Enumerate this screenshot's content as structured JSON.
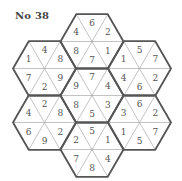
{
  "puzzle": {
    "title": "No 38",
    "layout": "flower-of-7-hexagons",
    "triangle_order": [
      "top",
      "top-right",
      "bottom-right",
      "bottom",
      "bottom-left",
      "top-left"
    ],
    "hexagons": [
      {
        "position": "top",
        "values": [
          "6",
          "2",
          "1",
          "7",
          "8",
          "4"
        ]
      },
      {
        "position": "upper-left",
        "values": [
          "4",
          "8",
          "9",
          "2",
          "7",
          "1"
        ]
      },
      {
        "position": "upper-right",
        "values": [
          "5",
          "7",
          "2",
          "6",
          "4",
          "1"
        ]
      },
      {
        "position": "center",
        "values": [
          "7",
          "4",
          "3",
          "5",
          "8",
          "9"
        ]
      },
      {
        "position": "lower-left",
        "values": [
          "2",
          "8",
          "2",
          "9",
          "6",
          "4"
        ]
      },
      {
        "position": "lower-right",
        "values": [
          "6",
          "2",
          "7",
          "5",
          "1",
          "3"
        ]
      },
      {
        "position": "bottom",
        "values": [
          "5",
          "1",
          "4",
          "8",
          "7",
          "2"
        ]
      }
    ],
    "colors": {
      "outline": "#555555",
      "inner_lines": "#9a9a9a",
      "numbers": "#555555",
      "background": "#ffffff"
    }
  }
}
